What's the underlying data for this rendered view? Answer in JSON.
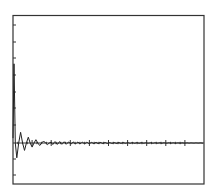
{
  "chart_data": {
    "type": "line",
    "title": "",
    "xlabel": "",
    "ylabel": "",
    "grid": false,
    "legend": null,
    "xlim": [
      0,
      10
    ],
    "ylim": [
      -1,
      6
    ],
    "x_ticks": [
      0,
      1,
      2,
      3,
      4,
      5,
      6,
      7,
      8,
      9,
      10
    ],
    "y_ticks": [
      -1,
      0,
      1,
      2,
      3,
      4,
      5,
      6
    ],
    "series": [
      {
        "name": "response",
        "color": "#222222",
        "x": [
          0,
          0.05,
          0.12,
          0.2,
          0.3,
          0.4,
          0.5,
          0.6,
          0.7,
          0.8,
          0.9,
          1.0,
          1.1,
          1.2,
          1.3,
          1.4,
          1.5,
          1.6,
          1.7,
          1.8,
          1.9,
          2.0,
          2.2,
          2.4,
          2.6,
          2.8,
          3.0,
          3.5,
          4.0,
          5.0,
          6.0,
          7.0,
          8.0,
          9.0,
          10.0
        ],
        "values": [
          0.3,
          4.8,
          0.0,
          -0.9,
          0.0,
          0.65,
          0.0,
          -0.45,
          0.0,
          0.35,
          0.0,
          -0.25,
          0.0,
          0.2,
          0.0,
          -0.15,
          0.0,
          0.12,
          0.0,
          -0.1,
          0.0,
          0.08,
          -0.06,
          0.05,
          -0.04,
          0.03,
          -0.03,
          0.02,
          -0.02,
          0.01,
          -0.01,
          0.0,
          0.0,
          0.0,
          0.0
        ]
      }
    ]
  },
  "colors": {
    "axis": "#333333",
    "line": "#222222",
    "background": "#ffffff"
  }
}
